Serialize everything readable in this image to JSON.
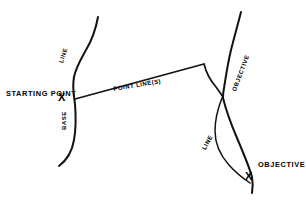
{
  "diagram": {
    "background_color": "#ffffff",
    "stroke_color": "#111111",
    "labels": {
      "starting_point": "STARTING POINT",
      "objective_point": "OBJECTIVE",
      "line_top": "LINE",
      "base": "BASE",
      "point_lines": "POINT LINE(S)",
      "objective_curve": "OBJECTIVE",
      "line_lower": "LINE"
    },
    "markers": {
      "start_marker": "X",
      "objective_marker": "X"
    }
  }
}
